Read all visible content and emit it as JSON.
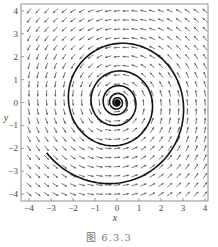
{
  "chart_data": {
    "type": "vector-field-phase-portrait",
    "title": "",
    "xlabel": "x",
    "ylabel": "y",
    "xlim": [
      -4.3,
      4.3
    ],
    "ylim": [
      -4.3,
      4.3
    ],
    "xticks": [
      -4,
      -3,
      -2,
      -1,
      0,
      1,
      2,
      3,
      4
    ],
    "yticks": [
      -4,
      -3,
      -2,
      -1,
      0,
      1,
      2,
      3,
      4
    ],
    "grid": false,
    "vector_field": {
      "description": "direction field x' = -y - 0.1x, y' = x - 0.1y (counterclockwise inward spiral)",
      "grid_range": [
        -4,
        4
      ],
      "grid_step": 0.4,
      "rotation": "counterclockwise",
      "damping": 0.1
    },
    "trajectory": {
      "description": "single solution curve spiraling inward to origin",
      "start": [
        -3.2,
        -2.2
      ],
      "end": [
        0,
        0
      ],
      "decay": 0.1
    },
    "colors": {
      "arrows": "#555555",
      "trajectory": "#111111",
      "frame": "#777777"
    }
  },
  "caption": "图 6.3.3"
}
